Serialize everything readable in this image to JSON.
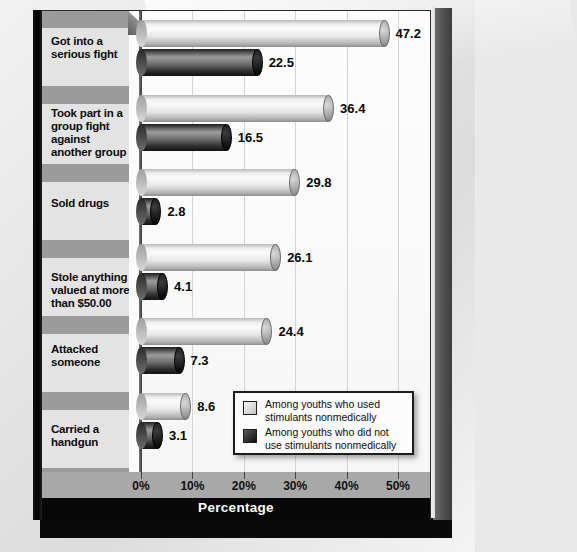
{
  "chart_data": {
    "type": "bar",
    "orientation": "horizontal",
    "title": "",
    "xlabel": "Percentage",
    "ylabel": "",
    "xlim": [
      0,
      52
    ],
    "grid": true,
    "legend_position": "bottom-right",
    "xticks": [
      "0%",
      "10%",
      "20%",
      "30%",
      "40%",
      "50%"
    ],
    "xtick_values": [
      0,
      10,
      20,
      30,
      40,
      50
    ],
    "categories": [
      "Got into a serious fight",
      "Took part in a group fight against another group",
      "Sold drugs",
      "Stole anything valued at more than $50.00",
      "Attacked someone",
      "Carried a handgun"
    ],
    "series": [
      {
        "name": "Among youths who used stimulants nonmedically",
        "color": "#e8e8e8",
        "values": [
          47.2,
          36.4,
          29.8,
          26.1,
          24.4,
          8.6
        ]
      },
      {
        "name": "Among youths who did not use stimulants nonmedically",
        "color": "#2e2e2e",
        "values": [
          22.5,
          16.5,
          2.8,
          4.1,
          7.3,
          3.1
        ]
      }
    ]
  },
  "legend": {
    "items": [
      {
        "label_line1": "Among youths who used",
        "label_line2": "stimulants nonmedically"
      },
      {
        "label_line1": "Among youths who did not",
        "label_line2": "use stimulants nonmedically"
      }
    ]
  },
  "colors": {
    "board": "#fbfbfb",
    "band_light": "#e3e3e3",
    "band_dark": "#9b9b9b",
    "axis_band": "#a8a8a8",
    "xtitle_band": "#080808",
    "text": "#0c0c0c"
  }
}
